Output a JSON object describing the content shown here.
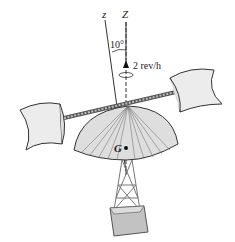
{
  "figure": {
    "axis_labels": {
      "z_body": "z",
      "Z_fixed": "Z",
      "center_of_mass": "G"
    },
    "angle_label": "10°",
    "angular_rate_label": "2 rev/h",
    "components": [
      "two cylindrical scoop cups",
      "rotating rod",
      "dome canopy",
      "lattice tower",
      "base block"
    ],
    "colors": {
      "stroke": "#333333",
      "fill_light": "#e6e6e6",
      "fill_dome": "#dedede",
      "tower": "#8a8a8a",
      "base": "#b5b5b5"
    }
  }
}
